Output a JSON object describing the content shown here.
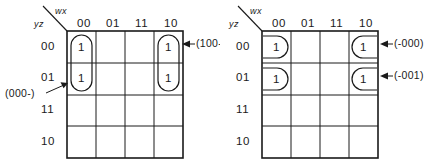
{
  "figure": {
    "name": "karnaugh-map-pair",
    "maps": [
      {
        "id": "left",
        "axis_labels": {
          "columns": "wx",
          "rows": "yz"
        },
        "column_headers": [
          "00",
          "01",
          "11",
          "10"
        ],
        "row_headers": [
          "00",
          "01",
          "11",
          "10"
        ],
        "cells": [
          [
            "1",
            "",
            "",
            "1"
          ],
          [
            "1",
            "",
            "",
            "1"
          ],
          [
            "",
            "",
            "",
            ""
          ],
          [
            "",
            "",
            "",
            ""
          ]
        ],
        "groups": [
          {
            "name": "group-col00-rows00-01",
            "shape": "stadium-vertical",
            "column": "00",
            "rows": [
              "00",
              "01"
            ]
          },
          {
            "name": "group-col10-rows00-01",
            "shape": "stadium-vertical",
            "column": "10",
            "rows": [
              "00",
              "01"
            ]
          }
        ],
        "annotations": [
          {
            "name": "annotation-100-dash",
            "text": "(100-)",
            "points_to": "group-col10-rows00-01",
            "side": "right"
          },
          {
            "name": "annotation-000-dash",
            "text": "(000-)",
            "points_to": "group-col00-rows00-01",
            "side": "left"
          }
        ]
      },
      {
        "id": "right",
        "axis_labels": {
          "columns": "wx",
          "rows": "yz"
        },
        "column_headers": [
          "00",
          "01",
          "11",
          "10"
        ],
        "row_headers": [
          "00",
          "01",
          "11",
          "10"
        ],
        "cells": [
          [
            "1",
            "",
            "",
            "1"
          ],
          [
            "1",
            "",
            "",
            "1"
          ],
          [
            "",
            "",
            "",
            ""
          ],
          [
            "",
            "",
            "",
            ""
          ]
        ],
        "groups": [
          {
            "name": "group-row00-wrap-left",
            "shape": "d-open-left",
            "column": "00",
            "rows": [
              "00"
            ]
          },
          {
            "name": "group-row01-wrap-left",
            "shape": "d-open-left",
            "column": "00",
            "rows": [
              "01"
            ]
          },
          {
            "name": "group-row00-wrap-right",
            "shape": "d-open-right",
            "column": "10",
            "rows": [
              "00"
            ]
          },
          {
            "name": "group-row01-wrap-right",
            "shape": "d-open-right",
            "column": "10",
            "rows": [
              "01"
            ]
          }
        ],
        "annotations": [
          {
            "name": "annotation-dash-000",
            "text": "(-000)",
            "points_to": "group-row00-wrap-right",
            "side": "right"
          },
          {
            "name": "annotation-dash-001",
            "text": "(-001)",
            "points_to": "group-row01-wrap-right",
            "side": "right"
          }
        ]
      }
    ],
    "colors": {
      "ink": "#1a1a1a",
      "background": "#ffffff"
    }
  }
}
